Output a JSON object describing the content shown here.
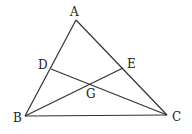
{
  "diagram": {
    "type": "geometry-triangle",
    "stroke_color": "#333333",
    "points": {
      "A": {
        "label": "A",
        "x": 76,
        "y": 20,
        "label_x": 70,
        "label_y": 16
      },
      "B": {
        "label": "B",
        "x": 25,
        "y": 116,
        "label_x": 13,
        "label_y": 122
      },
      "C": {
        "label": "C",
        "x": 167,
        "y": 115,
        "label_x": 172,
        "label_y": 121
      },
      "D": {
        "label": "D",
        "x": 51,
        "y": 69,
        "label_x": 38,
        "label_y": 69
      },
      "E": {
        "label": "E",
        "x": 123,
        "y": 68,
        "label_x": 127,
        "label_y": 68
      },
      "G": {
        "label": "G",
        "x": 90,
        "y": 84,
        "label_x": 86,
        "label_y": 98
      }
    },
    "segments": [
      {
        "from": "A",
        "to": "B"
      },
      {
        "from": "A",
        "to": "C"
      },
      {
        "from": "B",
        "to": "C"
      },
      {
        "from": "D",
        "to": "C"
      },
      {
        "from": "B",
        "to": "E"
      }
    ]
  }
}
